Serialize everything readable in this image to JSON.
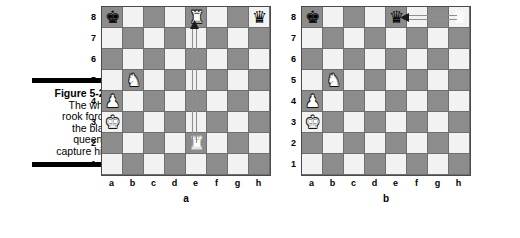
{
  "caption": {
    "title": "Figure 5-27:",
    "lines": [
      "The white",
      "rook forces",
      "the black",
      "queen to",
      "capture him."
    ]
  },
  "colors": {
    "light_square": "#f2f2f2",
    "dark_square": "#8c8c8c",
    "border": "#4a4a4a",
    "rule": "#000000"
  },
  "files": [
    "a",
    "b",
    "c",
    "d",
    "e",
    "f",
    "g",
    "h"
  ],
  "ranks": [
    "8",
    "7",
    "6",
    "5",
    "4",
    "3",
    "2",
    "1"
  ],
  "boards": [
    {
      "label": "a",
      "pieces": [
        {
          "square": "a8",
          "file": 0,
          "rank": 0,
          "glyph": "♚",
          "side": "black",
          "name": "black-king"
        },
        {
          "square": "e8",
          "file": 4,
          "rank": 0,
          "glyph": "♜",
          "side": "white",
          "name": "white-rook"
        },
        {
          "square": "h8",
          "file": 7,
          "rank": 0,
          "glyph": "♛",
          "side": "black",
          "name": "black-queen"
        },
        {
          "square": "b5",
          "file": 1,
          "rank": 3,
          "glyph": "♞",
          "side": "white",
          "name": "white-knight"
        },
        {
          "square": "a4",
          "file": 0,
          "rank": 4,
          "glyph": "♟",
          "side": "white",
          "name": "white-pawn"
        },
        {
          "square": "a3",
          "file": 0,
          "rank": 5,
          "glyph": "♚",
          "side": "white",
          "name": "white-king"
        },
        {
          "square": "e2",
          "file": 4,
          "rank": 6,
          "glyph": "♜",
          "side": "ghost",
          "name": "rook-origin-ghost"
        }
      ],
      "arrow": {
        "from": "e2",
        "to": "e8",
        "direction": "up",
        "name": "rook-move-arrow"
      }
    },
    {
      "label": "b",
      "pieces": [
        {
          "square": "a8",
          "file": 0,
          "rank": 0,
          "glyph": "♚",
          "side": "black",
          "name": "black-king"
        },
        {
          "square": "e8",
          "file": 4,
          "rank": 0,
          "glyph": "♛",
          "side": "black",
          "name": "black-queen"
        },
        {
          "square": "h8",
          "file": 7,
          "rank": 0,
          "glyph": "♛",
          "side": "ghost-plain",
          "name": "queen-origin-ghost"
        },
        {
          "square": "b5",
          "file": 1,
          "rank": 3,
          "glyph": "♞",
          "side": "white",
          "name": "white-knight"
        },
        {
          "square": "a4",
          "file": 0,
          "rank": 4,
          "glyph": "♟",
          "side": "white",
          "name": "white-pawn"
        },
        {
          "square": "a3",
          "file": 0,
          "rank": 5,
          "glyph": "♚",
          "side": "white",
          "name": "white-king"
        }
      ],
      "arrow": {
        "from": "h8",
        "to": "e8",
        "direction": "left",
        "name": "queen-capture-arrow"
      }
    }
  ]
}
